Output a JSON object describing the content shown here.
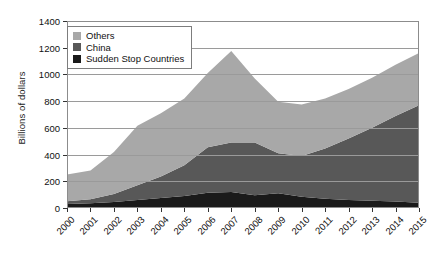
{
  "chart_data": {
    "type": "area",
    "stacked": true,
    "title": "",
    "xlabel": "",
    "ylabel": "Billions of dollars",
    "categories": [
      "2000",
      "2001",
      "2002",
      "2003",
      "2004",
      "2005",
      "2006",
      "2007",
      "2008",
      "2009",
      "2010",
      "2011",
      "2012",
      "2013",
      "2014",
      "2015"
    ],
    "ylim": [
      0,
      1400
    ],
    "yticks": [
      0,
      200,
      400,
      600,
      800,
      1000,
      1200,
      1400
    ],
    "grid": true,
    "legend_position": "top-left",
    "series": [
      {
        "name": "Sudden Stop Countries",
        "color": "#1a1a1a",
        "values": [
          30,
          35,
          45,
          60,
          75,
          90,
          115,
          120,
          95,
          110,
          85,
          70,
          60,
          55,
          48,
          40
        ]
      },
      {
        "name": "China",
        "color": "#585858",
        "values": [
          20,
          30,
          60,
          110,
          160,
          230,
          340,
          370,
          395,
          300,
          305,
          375,
          460,
          545,
          640,
          730
        ]
      },
      {
        "name": "Others",
        "color": "#a8a8a8",
        "values": [
          200,
          215,
          315,
          445,
          475,
          500,
          555,
          685,
          480,
          385,
          385,
          375,
          370,
          375,
          385,
          390
        ]
      }
    ],
    "totals": [
      250,
      280,
      420,
      615,
      710,
      820,
      1010,
      1175,
      970,
      795,
      775,
      820,
      890,
      975,
      1073,
      1160
    ]
  },
  "legend": {
    "items": [
      {
        "label": "Others",
        "color": "#a8a8a8"
      },
      {
        "label": "China",
        "color": "#585858"
      },
      {
        "label": "Sudden Stop Countries",
        "color": "#1a1a1a"
      }
    ]
  },
  "axes": {
    "y_title": "Billions of dollars"
  }
}
